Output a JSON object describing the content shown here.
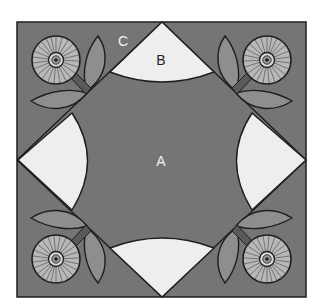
{
  "diagram": {
    "title": "",
    "labels": {
      "a": "A",
      "b": "B",
      "c": "C"
    },
    "colors": {
      "background": "#757575",
      "wedge": "#eeeeee",
      "leaf": "#8e8e8e",
      "stem": "#5a5a5a",
      "outline": "#1e1e1e",
      "flower_face": "#b8b8b8",
      "label_on_dark": "#f2f2f2",
      "label_on_light": "#222222"
    },
    "pieces": [
      {
        "id": "A",
        "description": "central background square"
      },
      {
        "id": "B",
        "description": "quarter-circle wedges on each edge (4)"
      },
      {
        "id": "C",
        "description": "corner triangles with flower appliqué (4)"
      }
    ]
  }
}
